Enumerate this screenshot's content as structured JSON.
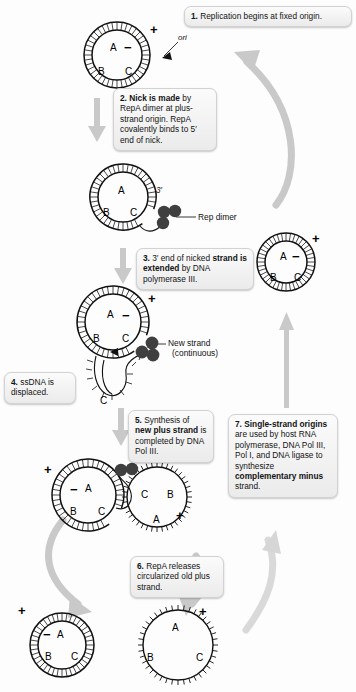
{
  "figure": {
    "type": "process-diagram"
  },
  "steps": [
    {
      "id": 1,
      "number": "1.",
      "text_plain": "Replication begins at fixed origin.",
      "html": "<span class=\"num\">1.</span> Replication begins at fixed origin."
    },
    {
      "id": 2,
      "number": "2.",
      "text_plain": "Nick is made by RepA dimer at plus-strand origin. RepA covalently binds to 5' end of nick.",
      "html": "<span class=\"num\">2. Nick is made</span> by RepA dimer at plus-strand origin. RepA covalently binds to 5&#8242; end of nick."
    },
    {
      "id": 3,
      "number": "3.",
      "text_plain": "3' end of nicked strand is extended by DNA polymerase III.",
      "html": "<span class=\"num\">3.</span> 3&#8242; end of nicked <b>strand is extended</b> by DNA polymerase III."
    },
    {
      "id": 4,
      "number": "4.",
      "text_plain": "ssDNA is displaced.",
      "html": "<span class=\"num\">4.</span> ssDNA is displaced."
    },
    {
      "id": 5,
      "number": "5.",
      "text_plain": "Synthesis of new plus strand is completed by DNA Pol III.",
      "html": "<span class=\"num\">5.</span> Synthesis of <b>new plus strand</b> is completed by DNA Pol III."
    },
    {
      "id": 6,
      "number": "6.",
      "text_plain": "RepA releases circularized old plus strand.",
      "html": "<span class=\"num\">6.</span> RepA releases circularized old plus strand."
    },
    {
      "id": 7,
      "number": "7.",
      "text_plain": "Single-strand origins are used by host RNA polymerase, DNA Pol III, Pol I, and DNA ligase to synthesize complementary minus strand.",
      "html": "<span class=\"num\">7. Single-strand origins</span> are used by host RNA polymerase, DNA Pol III, Pol I, and DNA ligase to synthesize <b>complementary minus</b> strand."
    }
  ],
  "annotations": {
    "ori": "ori",
    "rep_dimer": "Rep dimer",
    "new_strand_line1": "New strand",
    "new_strand_line2": "(continuous)",
    "three_prime": "3′"
  },
  "strand_labels": {
    "plus": "+",
    "minus": "−",
    "a": "A",
    "b": "B",
    "c": "C"
  },
  "molecules": [
    {
      "name": "plasmid-origin",
      "state": "double-stranded circle, intact",
      "labels": [
        "+",
        "−",
        "A",
        "B",
        "C"
      ],
      "marker": "ori"
    },
    {
      "name": "plasmid-nicked",
      "state": "double-stranded circle, nicked with Rep dimer bound",
      "labels": [
        "A",
        "B",
        "C",
        "3′"
      ],
      "marker": "Rep dimer"
    },
    {
      "name": "plasmid-extending",
      "state": "rolling circle, displaced ssDNA tail",
      "labels": [
        "+",
        "−",
        "A",
        "B",
        "C"
      ],
      "marker": "New strand (continuous)"
    },
    {
      "name": "plasmid-completed",
      "state": "double-stranded circle plus released single-strand circle",
      "labels": [
        "+",
        "−",
        "A",
        "B",
        "C"
      ],
      "marker": "Rep dimer"
    },
    {
      "name": "product-dsDNA",
      "state": "double-stranded daughter plasmid",
      "labels": [
        "+",
        "−",
        "A",
        "B",
        "C"
      ]
    },
    {
      "name": "product-ssDNA",
      "state": "single-stranded plus circle",
      "labels": [
        "+",
        "A",
        "B",
        "C"
      ]
    },
    {
      "name": "product-final-dsDNA",
      "state": "double-stranded plasmid restored after step 7",
      "labels": [
        "+",
        "−",
        "A",
        "B",
        "C"
      ]
    }
  ],
  "colors": {
    "callout_fill": "#f2f2f2",
    "callout_border": "#d2d2d2",
    "arrow_gray": "#c9c9c9",
    "dna_outline": "#111111",
    "rep_dimer": "#3f3f3f",
    "text": "#131313"
  }
}
